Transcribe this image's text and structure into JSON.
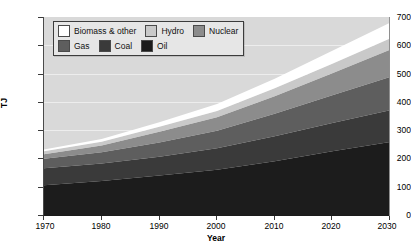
{
  "chart_data": {
    "type": "area",
    "stacked": true,
    "title": "",
    "xlabel": "Year",
    "ylabel": "TJ",
    "xlim": [
      1970,
      2030
    ],
    "ylim": [
      0,
      700
    ],
    "ytick_labels": [
      "700",
      "600",
      "500",
      "400",
      "300",
      "200",
      "100",
      "0"
    ],
    "ytick_values": [
      700,
      600,
      500,
      400,
      300,
      200,
      100,
      0
    ],
    "xtick_labels": [
      "1970",
      "1980",
      "1990",
      "2000",
      "2010",
      "2020",
      "2030"
    ],
    "xtick_values": [
      1970,
      1980,
      1990,
      2000,
      2010,
      2020,
      2030
    ],
    "grid": true,
    "legend_position": "upper-left",
    "x": [
      1970,
      1980,
      1990,
      2000,
      2010,
      2020,
      2030
    ],
    "series": [
      {
        "name": "Oil",
        "color": "#1c1c1c",
        "values": [
          105,
          120,
          140,
          160,
          190,
          225,
          258
        ]
      },
      {
        "name": "Coal",
        "color": "#3a3a3a",
        "values": [
          60,
          62,
          66,
          76,
          88,
          100,
          112
        ]
      },
      {
        "name": "Gas",
        "color": "#5e5e5e",
        "values": [
          34,
          40,
          50,
          62,
          80,
          98,
          118
        ]
      },
      {
        "name": "Nuclear",
        "color": "#8c8c8c",
        "values": [
          16,
          24,
          38,
          48,
          62,
          78,
          96
        ]
      },
      {
        "name": "Hydro",
        "color": "#c9c9c9",
        "values": [
          10,
          13,
          18,
          22,
          28,
          34,
          40
        ]
      },
      {
        "name": "Biomass & other",
        "color": "#ffffff",
        "values": [
          7,
          10,
          16,
          24,
          34,
          46,
          56
        ]
      }
    ],
    "totals": [
      232,
      269,
      328,
      392,
      482,
      581,
      680
    ],
    "plot_background": "#d9d9d9",
    "gridline_color": "#f0f0f0"
  },
  "legend": {
    "items": [
      {
        "label": "Biomass & other",
        "color": "#ffffff"
      },
      {
        "label": "Hydro",
        "color": "#c9c9c9"
      },
      {
        "label": "Nuclear",
        "color": "#8c8c8c"
      },
      {
        "label": "Gas",
        "color": "#5e5e5e"
      },
      {
        "label": "Coal",
        "color": "#3a3a3a"
      },
      {
        "label": "Oil",
        "color": "#1c1c1c"
      }
    ]
  }
}
